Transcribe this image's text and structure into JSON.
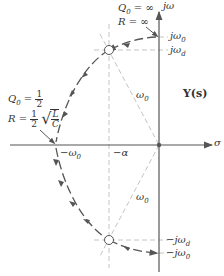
{
  "figure": {
    "title": "Y(s)",
    "axes": {
      "vertical_label": "jω",
      "horizontal_label": "σ"
    },
    "annotations": {
      "top_condition": {
        "q_label": "Q",
        "q_sub": "0",
        "q_value": "= ∞",
        "r_label": "R",
        "r_value": "= ∞"
      },
      "left_condition": {
        "q_label": "Q",
        "q_sub": "0",
        "q_eq": "=",
        "q_num": "1",
        "q_den": "2",
        "r_label": "R",
        "r_eq": "=",
        "r_num": "1",
        "r_den": "2",
        "sqrt_num": "L",
        "sqrt_den": "C"
      }
    },
    "tick_labels": {
      "j_omega0": "jω",
      "j_omega0_sub": "0",
      "j_omega_d": "jω",
      "j_omega_d_sub": "d",
      "neg_j_omega_d": "−jω",
      "neg_j_omega_d_sub": "d",
      "neg_j_omega0": "−jω",
      "neg_j_omega0_sub": "0",
      "neg_omega0": "−ω",
      "neg_omega0_sub": "0",
      "neg_alpha": "−α"
    },
    "radius_labels": {
      "upper": "ω",
      "upper_sub": "0",
      "lower": "ω",
      "lower_sub": "0"
    },
    "colors": {
      "axis": "#555555",
      "locus": "#555555",
      "dashed": "#bbbbbb",
      "pole_fill": "#ffffff"
    }
  }
}
